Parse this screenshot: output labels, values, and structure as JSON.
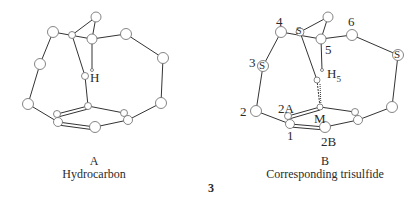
{
  "figure": {
    "number": "3",
    "panels": [
      {
        "id": "A",
        "letter": "A",
        "caption": "Hydrocarbon",
        "atom_labels": {
          "h": "H"
        }
      },
      {
        "id": "B",
        "letter": "B",
        "caption": "Corresponding trisulfide",
        "atom_labels": {
          "n1": "1",
          "n2": "2",
          "n2a": "2A",
          "n2b": "2B",
          "n3": "3",
          "n4": "4",
          "n5": "5",
          "n6": "6",
          "h5": "H",
          "h5_sub": "5",
          "m": "M",
          "s": "S"
        }
      }
    ],
    "colors": {
      "line": "#333333",
      "atom_fill": "#ffffff",
      "atom_stroke": "#777777"
    }
  }
}
